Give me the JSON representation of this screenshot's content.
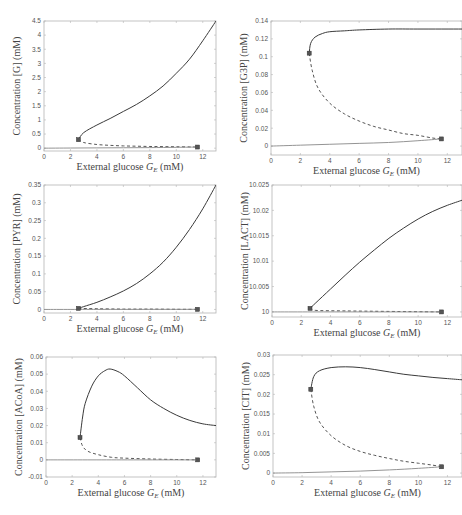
{
  "chart_data": [
    {
      "type": "line",
      "id": "G",
      "title": "",
      "xlabel": "External glucose G_E (mM)",
      "ylabel": "Concentration [G] (mM)",
      "xlim": [
        0,
        13
      ],
      "ylim": [
        -0.1,
        4.5
      ],
      "xticks": [
        "0",
        "2",
        "4",
        "6",
        "8",
        "10",
        "12"
      ],
      "yticks": [
        "0",
        "0.5",
        "1",
        "1.5",
        "2",
        "2.5",
        "3",
        "3.5",
        "4",
        "4.5"
      ],
      "series": [
        {
          "name": "stable upper",
          "style": "solid",
          "x": [
            2.6,
            3,
            4,
            5,
            6,
            7,
            8,
            9,
            10,
            11,
            12,
            13
          ],
          "y": [
            0.3,
            0.55,
            0.82,
            1.05,
            1.3,
            1.55,
            1.85,
            2.2,
            2.65,
            3.15,
            3.8,
            4.5
          ]
        },
        {
          "name": "unstable",
          "style": "dashed",
          "x": [
            2.6,
            3,
            4,
            5,
            6,
            7,
            8,
            9,
            10,
            11,
            11.6
          ],
          "y": [
            0.3,
            0.2,
            0.13,
            0.1,
            0.08,
            0.07,
            0.06,
            0.055,
            0.05,
            0.045,
            0.04
          ]
        },
        {
          "name": "stable lower",
          "style": "solid",
          "x": [
            0,
            2,
            4,
            6,
            8,
            10,
            11.6
          ],
          "y": [
            0.0,
            0.005,
            0.01,
            0.015,
            0.02,
            0.03,
            0.04
          ]
        }
      ],
      "markers": [
        {
          "x": 2.6,
          "y": 0.3
        },
        {
          "x": 11.6,
          "y": 0.04
        }
      ]
    },
    {
      "type": "line",
      "id": "G3P",
      "xlabel": "External glucose G_E (mM)",
      "ylabel": "Concentration [G3P] (mM)",
      "xlim": [
        0,
        13
      ],
      "ylim": [
        -0.01,
        0.14
      ],
      "xticks": [
        "0",
        "2",
        "4",
        "6",
        "8",
        "10",
        "12"
      ],
      "yticks": [
        "0",
        "0.02",
        "0.04",
        "0.06",
        "0.08",
        "0.1",
        "0.12",
        "0.14"
      ],
      "series": [
        {
          "name": "stable upper",
          "style": "solid",
          "x": [
            2.6,
            2.7,
            3,
            3.5,
            4,
            5,
            6,
            8,
            10,
            13
          ],
          "y": [
            0.104,
            0.115,
            0.122,
            0.126,
            0.128,
            0.129,
            0.13,
            0.131,
            0.131,
            0.131
          ]
        },
        {
          "name": "unstable",
          "style": "dashed",
          "x": [
            2.6,
            2.8,
            3.2,
            4,
            5,
            6,
            7,
            8,
            9,
            10,
            11,
            11.6
          ],
          "y": [
            0.104,
            0.085,
            0.065,
            0.048,
            0.036,
            0.028,
            0.022,
            0.018,
            0.014,
            0.012,
            0.009,
            0.008
          ]
        },
        {
          "name": "stable lower",
          "style": "solid",
          "x": [
            0,
            2,
            4,
            6,
            8,
            10,
            11.6
          ],
          "y": [
            0.0,
            0.001,
            0.002,
            0.003,
            0.004,
            0.006,
            0.008
          ]
        }
      ],
      "markers": [
        {
          "x": 2.6,
          "y": 0.104
        },
        {
          "x": 11.6,
          "y": 0.008
        }
      ]
    },
    {
      "type": "line",
      "id": "PYR",
      "xlabel": "External glucose G_E (mM)",
      "ylabel": "Concentration [PYR] (mM)",
      "xlim": [
        0,
        13
      ],
      "ylim": [
        -0.01,
        0.35
      ],
      "xticks": [
        "0",
        "2",
        "4",
        "6",
        "8",
        "10",
        "12"
      ],
      "yticks": [
        "0",
        "0.05",
        "0.1",
        "0.15",
        "0.2",
        "0.25",
        "0.3",
        "0.35"
      ],
      "series": [
        {
          "name": "stable upper",
          "style": "solid",
          "x": [
            2.6,
            3,
            4,
            5,
            6,
            7,
            8,
            9,
            10,
            11,
            12,
            13
          ],
          "y": [
            0.003,
            0.008,
            0.02,
            0.035,
            0.052,
            0.073,
            0.1,
            0.133,
            0.175,
            0.225,
            0.283,
            0.35
          ]
        },
        {
          "name": "unstable",
          "style": "dashed",
          "x": [
            2.6,
            4,
            6,
            8,
            10,
            11.6
          ],
          "y": [
            0.003,
            0.002,
            0.001,
            0.001,
            0.0005,
            0.0003
          ]
        },
        {
          "name": "stable lower",
          "style": "solid",
          "x": [
            0,
            4,
            8,
            11.6
          ],
          "y": [
            0.0,
            0.0001,
            0.0002,
            0.0003
          ]
        }
      ],
      "markers": [
        {
          "x": 2.6,
          "y": 0.003
        },
        {
          "x": 11.6,
          "y": 0.0003
        }
      ]
    },
    {
      "type": "line",
      "id": "LACT",
      "xlabel": "External glucose G_E (mM)",
      "ylabel": "Concentration [LACT] (mM)",
      "xlim": [
        0,
        13
      ],
      "ylim": [
        9.999,
        10.025
      ],
      "xticks": [
        "0",
        "2",
        "4",
        "6",
        "8",
        "10",
        "12"
      ],
      "yticks": [
        "10",
        "10.005",
        "10.01",
        "10.015",
        "10.02",
        "10.025"
      ],
      "series": [
        {
          "name": "stable upper",
          "style": "solid",
          "x": [
            2.6,
            3,
            4,
            5,
            6,
            7,
            8,
            9,
            10,
            11,
            12,
            13
          ],
          "y": [
            10.0007,
            10.0018,
            10.0045,
            10.0072,
            10.0098,
            10.0122,
            10.0145,
            10.0165,
            10.0183,
            10.0198,
            10.021,
            10.022
          ]
        },
        {
          "name": "unstable",
          "style": "dashed",
          "x": [
            2.6,
            3,
            5,
            8,
            11.6
          ],
          "y": [
            10.0007,
            10.0003,
            10.0002,
            10.0001,
            10.0
          ]
        },
        {
          "name": "stable lower",
          "style": "solid",
          "x": [
            0,
            5,
            11.6
          ],
          "y": [
            10.0,
            10.0,
            10.0
          ]
        }
      ],
      "markers": [
        {
          "x": 2.6,
          "y": 10.0007
        },
        {
          "x": 11.6,
          "y": 10.0
        }
      ]
    },
    {
      "type": "line",
      "id": "ACoA",
      "xlabel": "External glucose G_E (mM)",
      "ylabel": "Concentration [ACoA] (mM)",
      "xlim": [
        0,
        13
      ],
      "ylim": [
        -0.01,
        0.06
      ],
      "xticks": [
        "0",
        "2",
        "4",
        "6",
        "8",
        "10",
        "12"
      ],
      "yticks": [
        "-0.01",
        "0",
        "0.01",
        "0.02",
        "0.03",
        "0.04",
        "0.05",
        "0.06"
      ],
      "series": [
        {
          "name": "stable upper",
          "style": "solid",
          "x": [
            2.6,
            2.8,
            3,
            3.5,
            4,
            4.5,
            4.9,
            5.5,
            6,
            7,
            8,
            9,
            10,
            11,
            12,
            13
          ],
          "y": [
            0.013,
            0.025,
            0.033,
            0.043,
            0.049,
            0.052,
            0.053,
            0.0515,
            0.049,
            0.042,
            0.035,
            0.03,
            0.026,
            0.023,
            0.021,
            0.02
          ]
        },
        {
          "name": "unstable",
          "style": "dashed",
          "x": [
            2.6,
            2.8,
            3.2,
            4,
            5,
            6,
            8,
            10,
            11.6
          ],
          "y": [
            0.013,
            0.008,
            0.005,
            0.003,
            0.0015,
            0.001,
            0.0005,
            0.0002,
            0.0
          ]
        },
        {
          "name": "stable lower",
          "style": "solid",
          "x": [
            0,
            5,
            11.6
          ],
          "y": [
            0.0,
            0.0,
            0.0
          ]
        }
      ],
      "markers": [
        {
          "x": 2.6,
          "y": 0.013
        },
        {
          "x": 11.6,
          "y": 0.0
        }
      ]
    },
    {
      "type": "line",
      "id": "CIT",
      "xlabel": "External glucose G_E (mM)",
      "ylabel": "Concentration [CIT] (mM)",
      "xlim": [
        0,
        13
      ],
      "ylim": [
        -0.001,
        0.03
      ],
      "xticks": [
        "0",
        "2",
        "4",
        "6",
        "8",
        "10",
        "12"
      ],
      "yticks": [
        "0",
        "0.005",
        "0.01",
        "0.015",
        "0.02",
        "0.025",
        "0.03"
      ],
      "series": [
        {
          "name": "stable upper",
          "style": "solid",
          "x": [
            2.6,
            2.8,
            3.2,
            4,
            5,
            6,
            7,
            8,
            9,
            10,
            11,
            12,
            13
          ],
          "y": [
            0.0213,
            0.0245,
            0.026,
            0.0268,
            0.027,
            0.0268,
            0.0263,
            0.0257,
            0.0251,
            0.0247,
            0.0243,
            0.024,
            0.0237
          ]
        },
        {
          "name": "unstable",
          "style": "dashed",
          "x": [
            2.6,
            2.8,
            3.2,
            4,
            5,
            6,
            7,
            8,
            9,
            10,
            11,
            11.6
          ],
          "y": [
            0.0213,
            0.017,
            0.013,
            0.0095,
            0.007,
            0.0055,
            0.0045,
            0.0037,
            0.003,
            0.0025,
            0.002,
            0.0016
          ]
        },
        {
          "name": "stable lower",
          "style": "solid",
          "x": [
            0,
            2,
            4,
            6,
            8,
            10,
            11.6
          ],
          "y": [
            0.0,
            0.0001,
            0.0003,
            0.0005,
            0.0008,
            0.0012,
            0.0016
          ]
        }
      ],
      "markers": [
        {
          "x": 2.6,
          "y": 0.0213
        },
        {
          "x": 11.6,
          "y": 0.0016
        }
      ]
    }
  ],
  "panels": [
    {
      "x_label_main": "External glucose ",
      "x_label_var": "G",
      "x_label_sub": "E",
      "x_label_unit": " (mM)",
      "y_label": "Concentration [G] (mM)"
    },
    {
      "x_label_main": "External glucose ",
      "x_label_var": "G",
      "x_label_sub": "E",
      "x_label_unit": " (mM)",
      "y_label": "Concentration [G3P] (mM)"
    },
    {
      "x_label_main": "External glucose ",
      "x_label_var": "G",
      "x_label_sub": "E",
      "x_label_unit": " (mM)",
      "y_label": "Concentration [PYR] (mM)"
    },
    {
      "x_label_main": "External glucose ",
      "x_label_var": "G",
      "x_label_sub": "E",
      "x_label_unit": " (mM)",
      "y_label": "Concentration [LACT] (mM)"
    },
    {
      "x_label_main": "External glucose ",
      "x_label_var": "G",
      "x_label_sub": "E",
      "x_label_unit": " (mM)",
      "y_label": "Concentration [ACoA] (mM)"
    },
    {
      "x_label_main": "External glucose ",
      "x_label_var": "G",
      "x_label_sub": "E",
      "x_label_unit": " (mM)",
      "y_label": "Concentration [CIT] (mM)"
    }
  ]
}
